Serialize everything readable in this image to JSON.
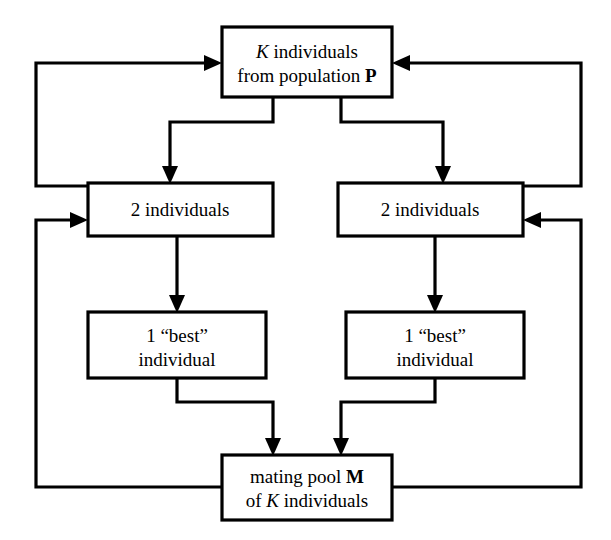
{
  "diagram": {
    "background_color": "#ffffff",
    "line_color": "#000000",
    "box_fill": "#ffffff",
    "nodes": {
      "population": {
        "line1_pre": "K",
        "line1_post": " individuals",
        "line2_pre": "from population ",
        "line2_post": "P"
      },
      "tournament_left": {
        "line1": "2 individuals"
      },
      "tournament_right": {
        "line1": "2 individuals"
      },
      "best_left": {
        "line1": "1 “best”",
        "line2": "individual"
      },
      "best_right": {
        "line1": "1 “best”",
        "line2": "individual"
      },
      "mating_pool": {
        "line1_pre": "mating pool ",
        "line1_post": "M",
        "line2_pre": "of ",
        "line2_mid": "K",
        "line2_post": " individuals"
      }
    }
  }
}
